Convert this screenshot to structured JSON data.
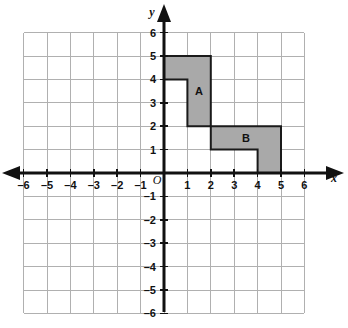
{
  "figure": {
    "title": "",
    "background_color": "#ffffff"
  },
  "chart_data": {
    "type": "scatter",
    "title": "",
    "xlabel": "x",
    "ylabel": "y",
    "xlim": [
      -6,
      6
    ],
    "ylim": [
      -6,
      6
    ],
    "grid": true,
    "grid_color": "#b0b0b0",
    "axis_color": "#111111",
    "x_ticks": [
      -6,
      -5,
      -4,
      -3,
      -2,
      -1,
      1,
      2,
      3,
      4,
      5,
      6
    ],
    "y_ticks": [
      6,
      5,
      4,
      3,
      2,
      1,
      -1,
      -2,
      -3,
      -4,
      -5,
      -6
    ],
    "x_tick_labels": [
      "-6",
      "-5",
      "-4",
      "-3",
      "-2",
      "-1",
      "1",
      "2",
      "3",
      "4",
      "5",
      "6"
    ],
    "y_tick_labels": [
      "6",
      "5",
      "4",
      "3",
      "2",
      "1",
      "-1",
      "-2",
      "-3",
      "-4",
      "-5",
      "-6"
    ],
    "origin_label": "O",
    "shapes": [
      {
        "name": "A",
        "label": "A",
        "fill": "#a9a9a9",
        "stroke": "#1a1a1a",
        "label_x": 1.5,
        "label_y": 3.5,
        "vertices": [
          [
            0,
            5
          ],
          [
            2,
            5
          ],
          [
            2,
            2
          ],
          [
            1,
            2
          ],
          [
            1,
            4
          ],
          [
            0,
            4
          ]
        ],
        "vertices_text": "(0,5) (2,5) (2,2) (1,2) (1,4) (0,4)"
      },
      {
        "name": "B",
        "label": "B",
        "fill": "#a9a9a9",
        "stroke": "#1a1a1a",
        "label_x": 3.5,
        "label_y": 1.5,
        "vertices": [
          [
            2,
            2
          ],
          [
            5,
            2
          ],
          [
            5,
            0
          ],
          [
            4,
            0
          ],
          [
            4,
            1
          ],
          [
            2,
            1
          ]
        ],
        "vertices_text": "(2,2) (5,2) (5,0) (4,0) (4,1) (2,1)"
      }
    ]
  }
}
